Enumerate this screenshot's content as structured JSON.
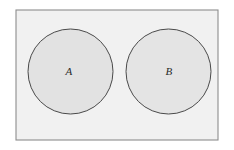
{
  "figure": {
    "kind": "venn-diagram",
    "canvas": {
      "width": 234,
      "height": 150,
      "background": "#ffffff"
    }
  },
  "universe_box": {
    "name": "universal-set-rectangle",
    "x": 16,
    "y": 10,
    "width": 202,
    "height": 130,
    "fill": "#f1f1f1",
    "stroke": "#8d8d8d",
    "stroke_width": 1.1
  },
  "sets": [
    {
      "id": "A",
      "label": "A",
      "cx": 70.5,
      "cy": 71.5,
      "r": 42.5,
      "fill": "#e2e2e2",
      "stroke": "#4a4a4a",
      "stroke_width": 1.0,
      "label_x": 69,
      "label_y": 72
    },
    {
      "id": "B",
      "label": "B",
      "cx": 168.5,
      "cy": 71.5,
      "r": 42.5,
      "fill": "#e4e4e4",
      "stroke": "#4a4a4a",
      "stroke_width": 1.0,
      "label_x": 169,
      "label_y": 72
    }
  ],
  "colors": {
    "page_background": "#ffffff",
    "box_fill": "#f1f1f1",
    "box_stroke": "#8d8d8d",
    "circle_fill": "#e2e2e2",
    "circle_stroke": "#4a4a4a",
    "label_text": "#2b2b2b"
  }
}
